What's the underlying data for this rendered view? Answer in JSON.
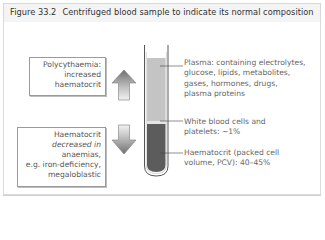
{
  "figure": {
    "number": "Figure 33.2",
    "title": "Centrifuged blood sample to indicate its normal composition"
  },
  "left_boxes": {
    "increase": {
      "lines": [
        "Polycythaemia:",
        "increased",
        "haematocrit"
      ],
      "arrow": "up-arrow-icon"
    },
    "decrease": {
      "lines": [
        "Haematocrit",
        "decreased in",
        "anaemias,",
        "e.g. iron-deficiency,",
        "megaloblastic"
      ],
      "arrow": "down-arrow-icon"
    }
  },
  "tube": {
    "layers": [
      {
        "name": "plasma",
        "color": "#c4c4c4"
      },
      {
        "name": "buffy-coat",
        "color": "#e6e6e6"
      },
      {
        "name": "red-cells",
        "color": "#5a5a5a"
      }
    ],
    "glass_color": "#444444"
  },
  "labels": {
    "plasma": [
      "Plasma: containing electrolytes,",
      "glucose, lipids, metabolites,",
      "gases, hormones, drugs,",
      "plasma proteins"
    ],
    "wbc": [
      "White blood cells and",
      "platelets: ~1%"
    ],
    "haematocrit": [
      "Haematocrit (packed cell",
      "volume, PCV): 40–45%"
    ]
  }
}
